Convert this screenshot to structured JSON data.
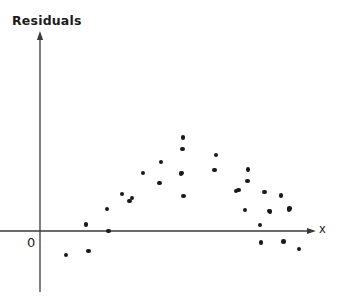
{
  "figure": {
    "background_color": "#ffffff",
    "ink_color": "#1a1a1a"
  },
  "labels": {
    "y_axis_title": "Residuals",
    "x_axis_title": "x",
    "origin_label": "0"
  },
  "axes": {
    "origin_px": {
      "x": 40,
      "y": 231
    },
    "y_axis": {
      "x_px": 40,
      "top_px": 33,
      "bottom_px": 292,
      "arrow": "up",
      "color": "#3a3a3a"
    },
    "x_axis": {
      "y_px": 231,
      "left_px": 0,
      "right_px": 315,
      "arrow": "right",
      "color": "#3a3a3a"
    }
  },
  "chart_data": {
    "type": "scatter",
    "title": "",
    "xlabel": "x",
    "ylabel": "Residuals",
    "grid": false,
    "legend": null,
    "annotations": [
      "0"
    ],
    "axis_ranges": {
      "note": "unlabeled axes; values read in pixel space relative to origin at (40,231)"
    },
    "point_count": 33,
    "marker": {
      "shape": "circle",
      "size_px": 4.4,
      "color": "#1a1a1a"
    },
    "points_px": [
      {
        "x": 65.7,
        "y": 254.7
      },
      {
        "x": 88.3,
        "y": 251.0
      },
      {
        "x": 86.0,
        "y": 224.3
      },
      {
        "x": 108.3,
        "y": 230.7
      },
      {
        "x": 107.0,
        "y": 208.7
      },
      {
        "x": 122.0,
        "y": 193.7
      },
      {
        "x": 129.3,
        "y": 201.0
      },
      {
        "x": 131.7,
        "y": 198.0
      },
      {
        "x": 142.7,
        "y": 173.0
      },
      {
        "x": 159.3,
        "y": 182.7
      },
      {
        "x": 160.7,
        "y": 161.7
      },
      {
        "x": 181.0,
        "y": 173.3
      },
      {
        "x": 182.7,
        "y": 137.3
      },
      {
        "x": 182.3,
        "y": 149.0
      },
      {
        "x": 182.0,
        "y": 172.7
      },
      {
        "x": 183.3,
        "y": 195.7
      },
      {
        "x": 216.0,
        "y": 155.0
      },
      {
        "x": 214.3,
        "y": 170.0
      },
      {
        "x": 236.0,
        "y": 190.7
      },
      {
        "x": 244.7,
        "y": 210.0
      },
      {
        "x": 247.3,
        "y": 181.0
      },
      {
        "x": 247.7,
        "y": 169.3
      },
      {
        "x": 260.0,
        "y": 225.0
      },
      {
        "x": 261.0,
        "y": 242.3
      },
      {
        "x": 264.3,
        "y": 191.7
      },
      {
        "x": 269.0,
        "y": 210.7
      },
      {
        "x": 281.0,
        "y": 195.3
      },
      {
        "x": 283.3,
        "y": 241.3
      },
      {
        "x": 289.3,
        "y": 208.3
      },
      {
        "x": 238.3,
        "y": 190.0
      },
      {
        "x": 269.7,
        "y": 211.3
      },
      {
        "x": 289.0,
        "y": 209.3
      },
      {
        "x": 298.7,
        "y": 249.0
      }
    ]
  }
}
